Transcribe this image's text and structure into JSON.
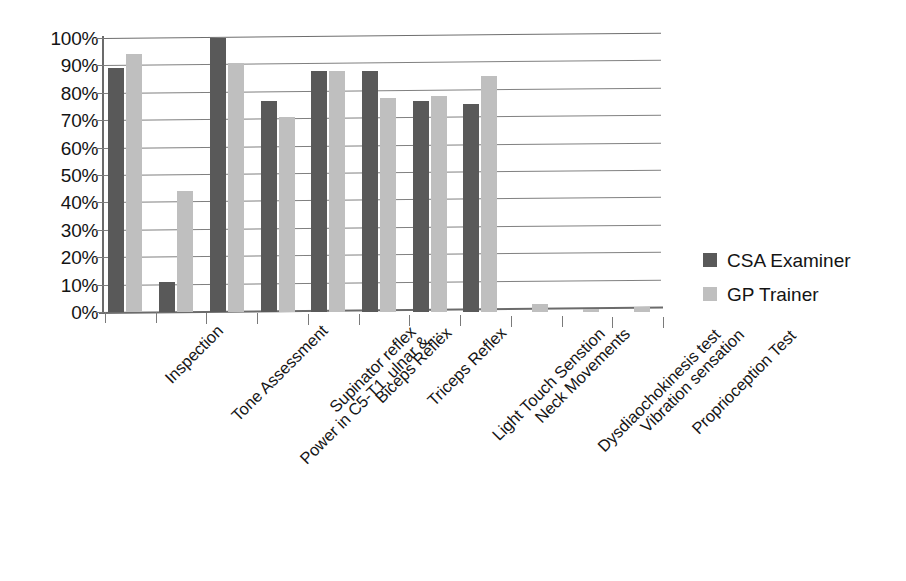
{
  "chart_data": {
    "type": "bar",
    "title": "",
    "subtitle": "",
    "xlabel": "",
    "ylabel": "",
    "ylim": [
      0,
      100
    ],
    "grid": true,
    "legend_position": "right",
    "value_suffix": "%",
    "categories": [
      "Inspection",
      "Tone Assessment",
      "Power in C5-T1, ulnar &...",
      "Supinator reflex",
      "Biceps Reflex",
      "Triceps Reflex",
      "Light Touch Senstion",
      "Neck Movements",
      "Dysdiaochokinesis test",
      "Vibration sensation",
      "Proprioception Test"
    ],
    "series": [
      {
        "name": "CSA Examiner",
        "color": "#595959",
        "values": [
          89,
          11,
          100,
          77,
          88,
          88,
          77,
          76,
          0,
          0,
          0
        ]
      },
      {
        "name": "GP Trainer",
        "color": "#bfbfbf",
        "values": [
          94,
          44,
          91,
          71,
          88,
          78,
          79,
          86,
          3,
          1,
          2
        ]
      }
    ],
    "y_ticks": [
      {
        "value": 100,
        "label": "100%"
      },
      {
        "value": 90,
        "label": "90%"
      },
      {
        "value": 80,
        "label": "80%"
      },
      {
        "value": 70,
        "label": "70%"
      },
      {
        "value": 60,
        "label": "60%"
      },
      {
        "value": 50,
        "label": "50%"
      },
      {
        "value": 40,
        "label": "40%"
      },
      {
        "value": 30,
        "label": "30%"
      },
      {
        "value": 20,
        "label": "20%"
      },
      {
        "value": 10,
        "label": "10%"
      },
      {
        "value": 0,
        "label": "0%"
      }
    ]
  },
  "legend": {
    "items": [
      {
        "label": "CSA Examiner",
        "color": "#595959",
        "swatch": "square-swatch"
      },
      {
        "label": "GP Trainer",
        "color": "#bfbfbf",
        "swatch": "square-swatch"
      }
    ]
  }
}
